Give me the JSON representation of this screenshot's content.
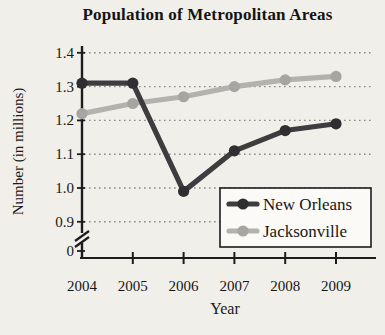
{
  "title": "Population of Metropolitan Areas",
  "chart_data": {
    "type": "line",
    "x": [
      "2004",
      "2005",
      "2006",
      "2007",
      "2008",
      "2009"
    ],
    "series": [
      {
        "name": "New Orleans",
        "color": "#3d3d40",
        "marker_color": "#2f2f32",
        "values": [
          1.31,
          1.31,
          0.99,
          1.11,
          1.17,
          1.19
        ]
      },
      {
        "name": "Jacksonville",
        "color": "#b3b2ae",
        "marker_color": "#a6a5a1",
        "values": [
          1.22,
          1.25,
          1.27,
          1.3,
          1.32,
          1.33
        ]
      }
    ],
    "xlabel": "Year",
    "ylabel": "Number (in millions)",
    "y_ticks": [
      1.4,
      1.3,
      1.2,
      1.1,
      1.0,
      0.9
    ],
    "y_tick_labels": [
      "1.4",
      "1.3",
      "1.2",
      "1.1",
      "1.0",
      "0.9"
    ],
    "y_zero_label": "0",
    "ylim": [
      0.9,
      1.4
    ],
    "axis_break": true,
    "grid": "horizontal-dotted",
    "legend": {
      "position": "lower-right",
      "entries": [
        "New Orleans",
        "Jacksonville"
      ]
    }
  },
  "colors": {
    "background": "#f1efe9",
    "axis": "#1c1c1c",
    "grid": "#8d8b86",
    "text": "#161616",
    "legend_bg": "#fbfaf7",
    "legend_border": "#1c1c1c"
  }
}
